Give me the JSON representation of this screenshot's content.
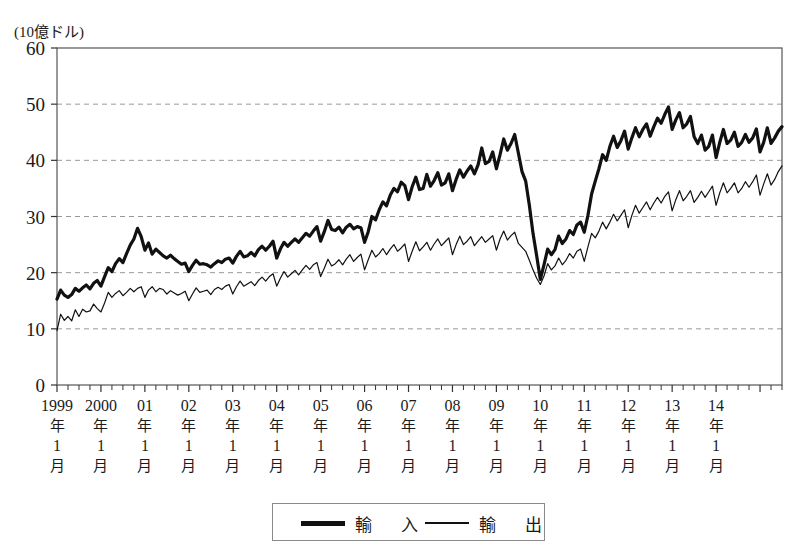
{
  "chart_data": {
    "type": "line",
    "title": "",
    "unit_label": "(10億ドル)",
    "ylabel": "",
    "xlabel": "",
    "ylim": [
      0,
      60
    ],
    "yticks": [
      0,
      10,
      20,
      30,
      40,
      50,
      60
    ],
    "grid": true,
    "legend_position": "bottom",
    "x_tick_labels": [
      "1999年1月",
      "2000年1月",
      "01年1月",
      "02年1月",
      "03年1月",
      "04年1月",
      "05年1月",
      "06年1月",
      "07年1月",
      "08年1月",
      "09年1月",
      "10年1月",
      "11年1月",
      "12年1月",
      "13年1月",
      "14年1月"
    ],
    "x_tick_parts": [
      {
        "year": "1999",
        "nen": "年",
        "month": "1",
        "gatsu": "月"
      },
      {
        "year": "2000",
        "nen": "年",
        "month": "1",
        "gatsu": "月"
      },
      {
        "year": "01",
        "nen": "年",
        "month": "1",
        "gatsu": "月"
      },
      {
        "year": "02",
        "nen": "年",
        "month": "1",
        "gatsu": "月"
      },
      {
        "year": "03",
        "nen": "年",
        "month": "1",
        "gatsu": "月"
      },
      {
        "year": "04",
        "nen": "年",
        "month": "1",
        "gatsu": "月"
      },
      {
        "year": "05",
        "nen": "年",
        "month": "1",
        "gatsu": "月"
      },
      {
        "year": "06",
        "nen": "年",
        "month": "1",
        "gatsu": "月"
      },
      {
        "year": "07",
        "nen": "年",
        "month": "1",
        "gatsu": "月"
      },
      {
        "year": "08",
        "nen": "年",
        "month": "1",
        "gatsu": "月"
      },
      {
        "year": "09",
        "nen": "年",
        "month": "1",
        "gatsu": "月"
      },
      {
        "year": "10",
        "nen": "年",
        "month": "1",
        "gatsu": "月"
      },
      {
        "year": "11",
        "nen": "年",
        "month": "1",
        "gatsu": "月"
      },
      {
        "year": "12",
        "nen": "年",
        "month": "1",
        "gatsu": "月"
      },
      {
        "year": "13",
        "nen": "年",
        "month": "1",
        "gatsu": "月"
      },
      {
        "year": "14",
        "nen": "年",
        "month": "1",
        "gatsu": "月"
      }
    ],
    "x_start": "1999-01",
    "x_end": "2014-07",
    "x_frequency": "monthly",
    "series": [
      {
        "name": "輸入",
        "style": "thick",
        "color": "#111111",
        "line_width": 3.2,
        "values": [
          15.3,
          16.9,
          16.0,
          15.6,
          16.1,
          17.2,
          16.7,
          17.3,
          17.8,
          17.1,
          18.1,
          18.6,
          17.6,
          19.3,
          20.9,
          20.2,
          21.6,
          22.5,
          21.8,
          23.4,
          24.9,
          26.0,
          27.9,
          26.4,
          24.0,
          25.3,
          23.3,
          24.2,
          23.6,
          23.0,
          22.6,
          23.1,
          22.5,
          22.0,
          21.5,
          21.7,
          20.2,
          21.3,
          22.2,
          21.5,
          21.6,
          21.4,
          21.0,
          21.6,
          22.1,
          21.8,
          22.4,
          22.6,
          21.7,
          22.9,
          23.8,
          22.8,
          23.0,
          23.6,
          23.0,
          24.1,
          24.7,
          24.0,
          24.7,
          25.6,
          22.6,
          24.2,
          25.4,
          24.7,
          25.4,
          26.0,
          25.4,
          26.2,
          27.0,
          26.5,
          27.4,
          28.2,
          25.6,
          27.3,
          29.3,
          27.7,
          27.5,
          28.1,
          27.1,
          28.1,
          28.6,
          27.8,
          28.2,
          28.0,
          25.4,
          27.3,
          30.0,
          29.4,
          31.2,
          32.6,
          31.9,
          33.8,
          35.0,
          34.4,
          36.1,
          35.5,
          33.0,
          35.3,
          37.0,
          34.8,
          35.0,
          37.5,
          35.4,
          36.4,
          37.8,
          35.6,
          36.0,
          37.6,
          34.6,
          36.6,
          38.3,
          37.0,
          38.1,
          39.0,
          37.6,
          39.2,
          42.2,
          39.4,
          39.8,
          41.5,
          38.5,
          41.0,
          43.8,
          41.8,
          43.0,
          44.6,
          41.3,
          38.0,
          36.3,
          32.0,
          27.0,
          23.0,
          18.8,
          21.4,
          24.2,
          23.2,
          24.1,
          26.5,
          25.2,
          26.0,
          27.5,
          26.8,
          28.5,
          29.0,
          27.2,
          30.2,
          34.0,
          36.3,
          38.5,
          41.0,
          40.0,
          42.5,
          44.3,
          42.3,
          43.5,
          45.2,
          42.0,
          44.0,
          45.8,
          44.2,
          45.5,
          46.5,
          44.3,
          46.0,
          47.5,
          46.6,
          48.2,
          49.5,
          45.5,
          47.2,
          48.5,
          45.8,
          46.5,
          47.8,
          44.2,
          43.0,
          44.5,
          41.8,
          42.5,
          44.5,
          40.5,
          43.2,
          45.5,
          43.0,
          43.6,
          45.0,
          42.5,
          43.2,
          44.6,
          43.2,
          44.0,
          45.6,
          41.5,
          43.2,
          45.8,
          43.0,
          44.0,
          45.2,
          46.0
        ]
      },
      {
        "name": "輸出",
        "style": "thin",
        "color": "#111111",
        "line_width": 1.2,
        "values": [
          9.7,
          12.6,
          11.5,
          12.2,
          11.4,
          13.4,
          12.2,
          13.5,
          13.0,
          13.2,
          14.4,
          13.6,
          13.0,
          14.6,
          16.5,
          15.6,
          16.3,
          16.8,
          15.9,
          16.5,
          17.2,
          16.6,
          17.2,
          17.5,
          15.6,
          16.9,
          17.5,
          16.6,
          17.2,
          17.0,
          16.2,
          16.8,
          16.4,
          16.0,
          16.3,
          16.7,
          15.0,
          16.2,
          17.3,
          16.5,
          16.7,
          16.9,
          16.1,
          17.0,
          17.4,
          17.0,
          17.6,
          17.9,
          16.2,
          17.5,
          18.5,
          17.6,
          18.0,
          18.4,
          17.7,
          18.6,
          19.2,
          18.5,
          19.3,
          19.8,
          17.6,
          19.0,
          20.2,
          19.2,
          19.8,
          20.4,
          19.6,
          20.5,
          21.3,
          20.6,
          21.4,
          21.8,
          19.3,
          20.8,
          22.4,
          21.2,
          21.6,
          22.3,
          21.4,
          22.4,
          23.2,
          22.0,
          22.7,
          23.3,
          20.5,
          22.3,
          24.0,
          22.8,
          23.4,
          24.3,
          23.2,
          24.2,
          25.0,
          23.8,
          24.4,
          25.1,
          22.0,
          23.8,
          25.5,
          23.9,
          24.6,
          25.4,
          24.0,
          25.1,
          26.0,
          24.8,
          25.5,
          26.2,
          23.2,
          25.0,
          26.5,
          25.0,
          25.6,
          26.4,
          24.8,
          25.6,
          26.4,
          25.4,
          26.0,
          26.6,
          24.0,
          26.0,
          27.4,
          25.8,
          26.6,
          27.2,
          25.2,
          24.5,
          23.8,
          22.2,
          20.5,
          19.0,
          17.9,
          19.4,
          21.6,
          20.5,
          21.2,
          22.6,
          21.4,
          22.2,
          23.4,
          22.6,
          23.8,
          24.2,
          22.0,
          24.6,
          27.0,
          26.2,
          27.4,
          29.0,
          27.8,
          29.0,
          30.4,
          29.2,
          30.2,
          31.2,
          28.0,
          30.2,
          32.0,
          30.6,
          31.6,
          32.6,
          31.2,
          32.4,
          33.4,
          32.4,
          33.6,
          34.4,
          31.0,
          33.0,
          34.6,
          32.8,
          33.6,
          34.6,
          32.5,
          33.4,
          34.5,
          33.4,
          34.4,
          35.4,
          32.0,
          34.2,
          36.0,
          34.2,
          35.0,
          36.0,
          34.2,
          35.0,
          36.2,
          35.2,
          36.2,
          37.4,
          33.8,
          35.8,
          37.6,
          35.6,
          36.6,
          38.0,
          39.0
        ]
      }
    ]
  },
  "legend": {
    "items": [
      {
        "label": "輸　入",
        "style": "thick"
      },
      {
        "label": "輸　出",
        "style": "thin"
      }
    ]
  },
  "axis": {
    "y_tick_labels": [
      "60",
      "50",
      "40",
      "30",
      "20",
      "10",
      "0"
    ]
  }
}
